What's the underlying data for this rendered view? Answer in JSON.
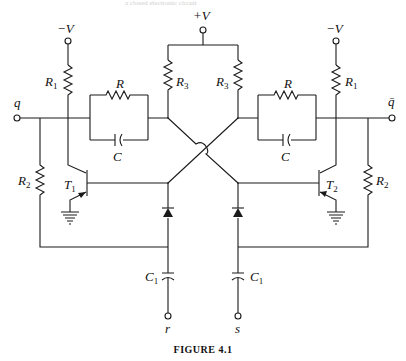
{
  "figure": {
    "caption": "FIGURE 4.1",
    "header_text": "a closed electronic circuit"
  },
  "labels": {
    "plus_v": "+V",
    "minus_v_left": "−V",
    "minus_v_right": "−V",
    "q": "q",
    "q_bar": "q̄",
    "r": "r",
    "s": "s",
    "R1_left": {
      "main": "R",
      "sub": "1"
    },
    "R1_right": {
      "main": "R",
      "sub": "1"
    },
    "R2_left": {
      "main": "R",
      "sub": "2"
    },
    "R2_right": {
      "main": "R",
      "sub": "2"
    },
    "R3_left": {
      "main": "R",
      "sub": "3"
    },
    "R3_right": {
      "main": "R",
      "sub": "3"
    },
    "R_left": "R",
    "R_right": "R",
    "C_left": "C",
    "C_right": "C",
    "C1_left": {
      "main": "C",
      "sub": "1"
    },
    "C1_right": {
      "main": "C",
      "sub": "1"
    },
    "T1": {
      "main": "T",
      "sub": "1"
    },
    "T2": {
      "main": "T",
      "sub": "2"
    }
  },
  "components": [
    {
      "id": "T1",
      "type": "npn-transistor"
    },
    {
      "id": "T2",
      "type": "npn-transistor"
    },
    {
      "id": "R1-left",
      "type": "resistor"
    },
    {
      "id": "R1-right",
      "type": "resistor"
    },
    {
      "id": "R2-left",
      "type": "resistor"
    },
    {
      "id": "R2-right",
      "type": "resistor"
    },
    {
      "id": "R3-left",
      "type": "resistor"
    },
    {
      "id": "R3-right",
      "type": "resistor"
    },
    {
      "id": "R-left",
      "type": "resistor"
    },
    {
      "id": "R-right",
      "type": "resistor"
    },
    {
      "id": "C-left",
      "type": "capacitor"
    },
    {
      "id": "C-right",
      "type": "capacitor"
    },
    {
      "id": "C1-left",
      "type": "capacitor"
    },
    {
      "id": "C1-right",
      "type": "capacitor"
    },
    {
      "id": "D-left",
      "type": "diode"
    },
    {
      "id": "D-right",
      "type": "diode"
    }
  ],
  "colors": {
    "line": "#1a1a1a",
    "background": "#ffffff"
  }
}
